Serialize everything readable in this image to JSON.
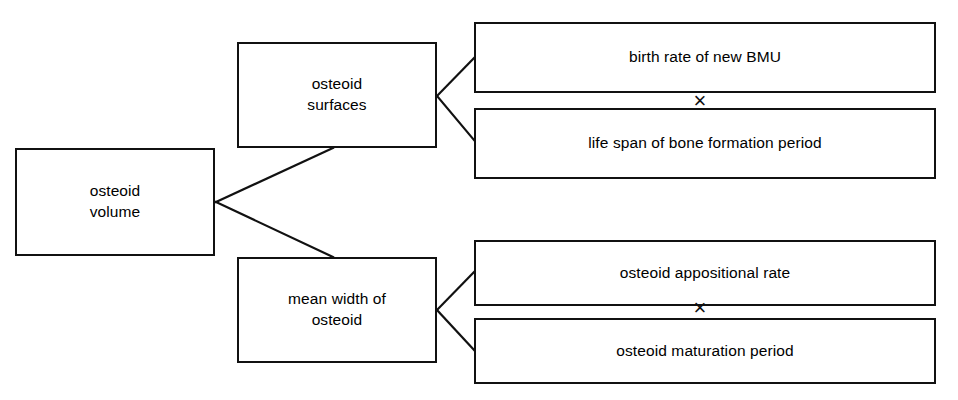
{
  "diagram": {
    "type": "hierarchical-decomposition-tree",
    "orientation": "left-to-right",
    "nodes": {
      "root": {
        "label": "osteoid\nvolume"
      },
      "branch_upper": {
        "label": "osteoid\nsurfaces"
      },
      "branch_lower": {
        "label": "mean width of\nosteoid"
      },
      "leaf_upper_1": {
        "label": "birth rate of new BMU"
      },
      "leaf_upper_2": {
        "label": "life span of bone formation period"
      },
      "leaf_lower_1": {
        "label": "osteoid appositional rate"
      },
      "leaf_lower_2": {
        "label": "osteoid maturation period"
      }
    },
    "operators": {
      "upper": {
        "symbol": "×",
        "name": "multiplication-operator"
      },
      "lower": {
        "symbol": "×",
        "name": "multiplication-operator"
      }
    },
    "style": {
      "line_color": "#111111",
      "box_fill": "#ffffff",
      "background": "#ffffff"
    }
  }
}
